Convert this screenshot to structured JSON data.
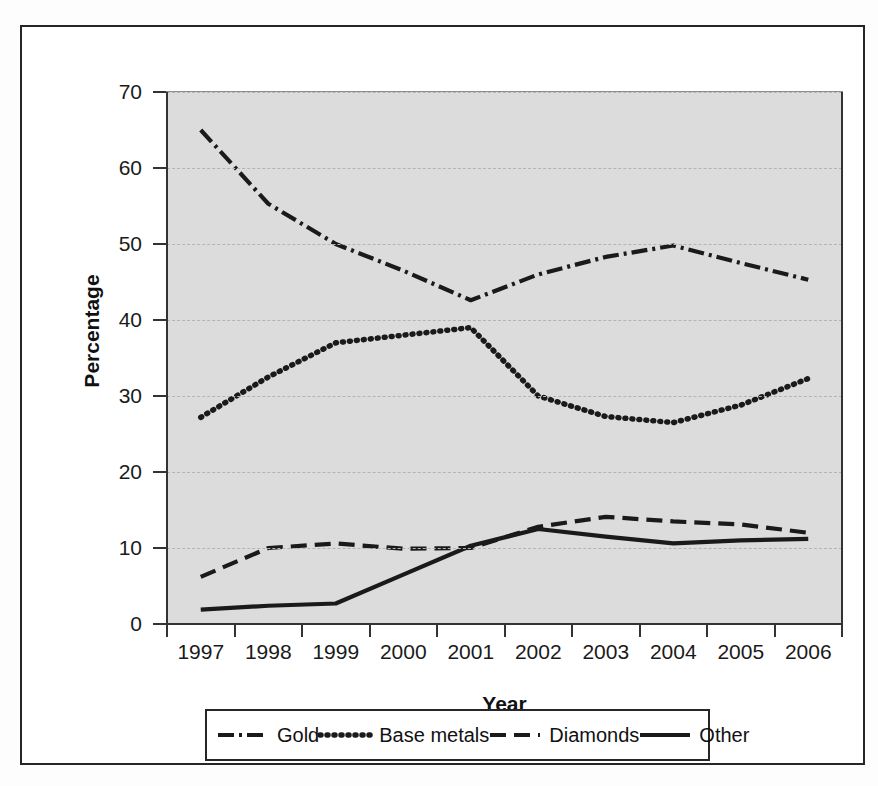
{
  "chart_data": {
    "type": "line",
    "title": "",
    "xlabel": "Year",
    "ylabel": "Percentage",
    "categories": [
      "1997",
      "1998",
      "1999",
      "2000",
      "2001",
      "2002",
      "2003",
      "2004",
      "2005",
      "2006"
    ],
    "x": [
      1997,
      1998,
      1999,
      2000,
      2001,
      2002,
      2003,
      2004,
      2005,
      2006
    ],
    "ylim": [
      0,
      70
    ],
    "yticks": [
      0,
      10,
      20,
      30,
      40,
      50,
      60,
      70
    ],
    "grid": true,
    "legend_position": "bottom",
    "series": [
      {
        "name": "Gold",
        "style": "dash-dot",
        "color": "#1a1a1a",
        "values": [
          65.0,
          55.3,
          50.0,
          46.5,
          42.6,
          46.0,
          48.3,
          49.8,
          47.5,
          45.3
        ]
      },
      {
        "name": "Base metals",
        "style": "dotted",
        "color": "#1a1a1a",
        "values": [
          27.2,
          32.5,
          37.0,
          38.0,
          39.0,
          30.0,
          27.3,
          26.5,
          28.8,
          32.3
        ]
      },
      {
        "name": "Diamonds",
        "style": "dashed",
        "color": "#1a1a1a",
        "values": [
          6.2,
          10.0,
          10.6,
          9.9,
          10.0,
          12.8,
          14.1,
          13.5,
          13.1,
          12.0
        ]
      },
      {
        "name": "Other",
        "style": "solid",
        "color": "#1a1a1a",
        "values": [
          1.9,
          2.4,
          2.7,
          6.5,
          10.3,
          12.5,
          11.5,
          10.6,
          11.0,
          11.2
        ]
      }
    ]
  },
  "axis": {
    "y_tick_labels": [
      "0",
      "10",
      "20",
      "30",
      "40",
      "50",
      "60",
      "70"
    ],
    "x_tick_labels": [
      "1997",
      "1998",
      "1999",
      "2000",
      "2001",
      "2002",
      "2003",
      "2004",
      "2005",
      "2006"
    ],
    "y_axis_title": "Percentage",
    "x_axis_title": "Year"
  },
  "legend": {
    "items": [
      {
        "label": "Gold",
        "style": "dash-dot"
      },
      {
        "label": "Base metals",
        "style": "dotted"
      },
      {
        "label": "Diamonds",
        "style": "dashed"
      },
      {
        "label": "Other",
        "style": "solid"
      }
    ]
  },
  "colors": {
    "plot_background": "#dcdcdc",
    "line": "#1a1a1a",
    "gridline": "#b4b4b4",
    "frame": "#262626"
  }
}
